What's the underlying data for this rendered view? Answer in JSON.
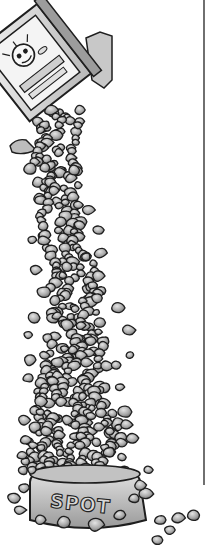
{
  "illustration": {
    "subject": "pet food bag pouring kibble into a dog bowl",
    "style": "black and white ink with grey shading",
    "bowl": {
      "label": "SPOT"
    },
    "bag": {
      "mascot": "cartoon dog face on bag front"
    },
    "divider_line": {
      "x": 204,
      "y_start": 0,
      "y_end": 485,
      "color": "#333333"
    }
  },
  "colors": {
    "background": "#ffffff",
    "outline": "#1e1e1e",
    "kibble_fill": "#a9a9a9",
    "kibble_light": "#d2d2d2",
    "bowl_fill": "#cfcfcf"
  }
}
